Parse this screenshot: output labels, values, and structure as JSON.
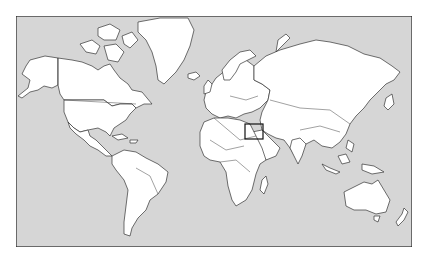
{
  "map": {
    "type": "world-political-outline",
    "projection": "Mercator",
    "colors": {
      "page_background": "#ffffff",
      "ocean": "#d6d6d6",
      "land": "#ffffff",
      "borders": "#333333",
      "frame": "#222222",
      "highlight_box": "#111111"
    },
    "frame": {
      "x": 16,
      "y": 16,
      "width": 396,
      "height": 231
    },
    "highlight": {
      "label": "",
      "region": "Eastern Mediterranean / Levant",
      "x": 245,
      "y": 124,
      "width": 18,
      "height": 15
    },
    "regions_shown": [
      "North America",
      "Greenland",
      "South America",
      "Europe",
      "Africa",
      "Asia",
      "Australia",
      "New Zealand"
    ]
  }
}
